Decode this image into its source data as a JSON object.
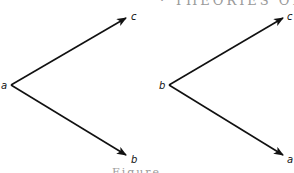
{
  "page": {
    "cropped_heading_text": "· THEORIES OF",
    "cropped_caption_text": "Figure"
  },
  "diagrams": [
    {
      "id": "left",
      "vertex": "a",
      "upper_target": "c",
      "lower_target": "b"
    },
    {
      "id": "right",
      "vertex": "b",
      "upper_target": "c",
      "lower_target": "a"
    }
  ],
  "colors": {
    "stroke": "#111111",
    "background": "#ffffff"
  }
}
